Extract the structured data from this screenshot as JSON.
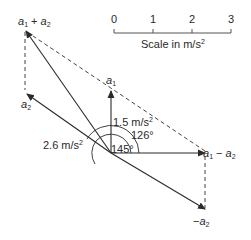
{
  "scale_bar": {
    "ticks": [
      "0",
      "1",
      "2",
      "3"
    ],
    "caption": "Scale in m/s",
    "caption_sup": "2"
  },
  "vectors": {
    "a1": {
      "name": "a",
      "sub": "1"
    },
    "a2": {
      "name": "a",
      "sub": "2"
    },
    "sum": {
      "name1": "a",
      "sub1": "1",
      "op": "+",
      "name2": "a",
      "sub2": "2"
    },
    "diff": {
      "name1": "a",
      "sub1": "1",
      "op": "−",
      "name2": "a",
      "sub2": "2"
    },
    "neg_a2": {
      "prefix": "−",
      "name": "a",
      "sub": "2"
    }
  },
  "magnitudes": {
    "a1": "1.5 m/s",
    "a1_sup": "2",
    "a2": "2.6 m/s",
    "a2_sup": "2"
  },
  "angles": {
    "inner": "126°",
    "outer": "145°"
  },
  "colors": {
    "line": "#2a2a2a",
    "dashed": "#444444"
  }
}
